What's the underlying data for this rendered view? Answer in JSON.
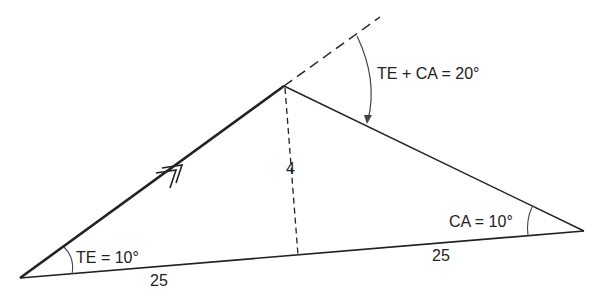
{
  "diagram": {
    "labels": {
      "sum_angle": "TE + CA = 20°",
      "te_angle": "TE = 10°",
      "ca_angle": "CA = 10°",
      "height": "4",
      "base_left": "25",
      "base_right": "25"
    },
    "colors": {
      "line": "#222222",
      "background": "#ffffff"
    }
  }
}
